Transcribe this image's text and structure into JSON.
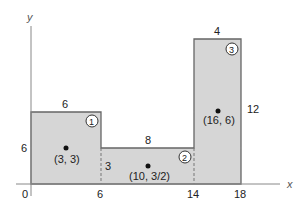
{
  "axes": {
    "x_label": "x",
    "y_label": "y",
    "origin_label": "0"
  },
  "x_ticks": [
    "6",
    "14",
    "18"
  ],
  "y_tick": "6",
  "colors": {
    "fill": "#d6d6d6",
    "stroke": "#666666",
    "axis": "#888888",
    "text": "#222222"
  },
  "regions": [
    {
      "id": "1",
      "top_label": "6",
      "side_label": "6",
      "centroid_label": "(3, 3)"
    },
    {
      "id": "2",
      "top_label": "8",
      "side_label": "3",
      "centroid_label": "(10, 3/2)"
    },
    {
      "id": "3",
      "top_label": "4",
      "side_label": "12",
      "centroid_label": "(16, 6)"
    }
  ]
}
